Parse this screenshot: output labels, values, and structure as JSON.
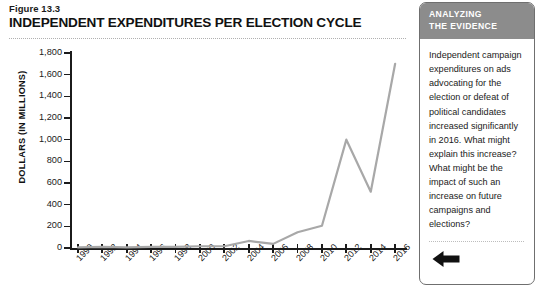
{
  "figure": {
    "number_label": "Figure 13.3",
    "title": "INDEPENDENT EXPENDITURES PER ELECTION CYCLE"
  },
  "sidebar": {
    "header_line1": "ANALYZING",
    "header_line2": "THE EVIDENCE",
    "body": "Independent campaign expenditures on ads advocating for the election or defeat of political candidates increased significantly in 2016. What might explain this increase? What might be the impact of such an increase on future campaigns and elections?",
    "back_arrow_icon": "left-arrow-icon",
    "border_color": "#6f6f6f",
    "header_background": "#8c8c8c"
  },
  "chart_data": {
    "type": "line",
    "title": "INDEPENDENT EXPENDITURES PER ELECTION CYCLE",
    "xlabel": "",
    "ylabel": "DOLLARS (IN MILLIONS)",
    "categories": [
      1990,
      1992,
      1994,
      1996,
      1998,
      2000,
      2002,
      2004,
      2006,
      2008,
      2010,
      2012,
      2014,
      2016
    ],
    "x_tick_labels": [
      "1990",
      "1992",
      "1994",
      "1996",
      "1998",
      "2000",
      "2002",
      "2004",
      "2006",
      "2008",
      "2010",
      "2012",
      "2014",
      "2016"
    ],
    "values": [
      5,
      11,
      5,
      10,
      10,
      16,
      16,
      65,
      38,
      145,
      205,
      1000,
      520,
      1700
    ],
    "series": [
      {
        "name": "Independent expenditures",
        "values": [
          5,
          11,
          5,
          10,
          10,
          16,
          16,
          65,
          38,
          145,
          205,
          1000,
          520,
          1700
        ],
        "color": "#a8a8a8"
      }
    ],
    "ylim": [
      0,
      1800
    ],
    "y_ticks": [
      0,
      200,
      400,
      600,
      800,
      1000,
      1200,
      1400,
      1600,
      1800
    ],
    "y_tick_labels": [
      "0",
      "200",
      "400",
      "600",
      "800",
      "1,000",
      "1,200",
      "1,400",
      "1,600",
      "1,800"
    ],
    "grid": false,
    "legend": false,
    "line_color": "#a8a8a8",
    "axis_color": "#1b1b1b"
  }
}
